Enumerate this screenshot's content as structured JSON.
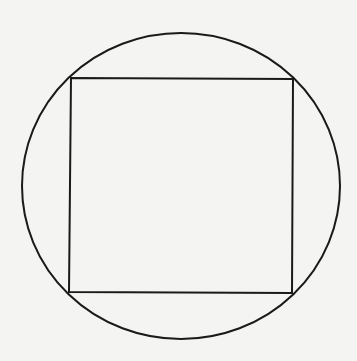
{
  "diagram": {
    "title": "",
    "background": "#f4f4f2",
    "stroke_color": "#1a1a1a",
    "circle": {
      "cx": 181,
      "cy": 186,
      "rx": 159,
      "ry": 153,
      "stroke_width": 2
    },
    "rectangle": {
      "corners": {
        "top_left": [
          71,
          78
        ],
        "top_right": [
          293,
          79
        ],
        "bottom_right": [
          292,
          293
        ],
        "bottom_left": [
          69,
          292
        ]
      },
      "stroke_width": 2
    },
    "labels": []
  }
}
